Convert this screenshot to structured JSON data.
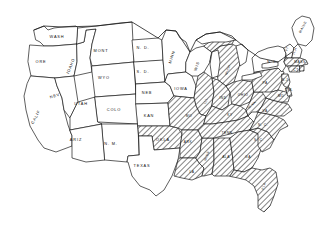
{
  "figure": {
    "background_color": "#ffffff",
    "line_color": "#1a1a1a",
    "shading_style": "diagonal-hatch",
    "shaded_meaning": "highlighted region",
    "width": 335,
    "height": 226
  },
  "legend": {
    "hatched_label": "shaded state",
    "plain_label": "unshaded state"
  },
  "states": [
    {
      "id": "washington",
      "label": "WASH",
      "shaded": false,
      "lx": 57,
      "ly": 37
    },
    {
      "id": "oregon",
      "label": "ORE",
      "shaded": false,
      "lx": 41,
      "ly": 62
    },
    {
      "id": "california",
      "label": "CALIF",
      "shaded": false,
      "lx": 36,
      "ly": 117
    },
    {
      "id": "nevada",
      "label": "NEV",
      "shaded": false,
      "lx": 55,
      "ly": 96
    },
    {
      "id": "idaho",
      "label": "IDAHO",
      "shaded": false,
      "lx": 71,
      "ly": 66
    },
    {
      "id": "montana",
      "label": "MONT",
      "shaded": false,
      "lx": 101,
      "ly": 51
    },
    {
      "id": "wyoming",
      "label": "WYO",
      "shaded": false,
      "lx": 104,
      "ly": 78
    },
    {
      "id": "utah",
      "label": "UTAH",
      "shaded": false,
      "lx": 81,
      "ly": 104
    },
    {
      "id": "colorado",
      "label": "COLO",
      "shaded": false,
      "lx": 114,
      "ly": 110
    },
    {
      "id": "arizona",
      "label": "ARIZ",
      "shaded": false,
      "lx": 76,
      "ly": 140
    },
    {
      "id": "newmexico",
      "label": "N. M.",
      "shaded": false,
      "lx": 111,
      "ly": 144
    },
    {
      "id": "northdakota",
      "label": "N. D.",
      "shaded": false,
      "lx": 143,
      "ly": 48
    },
    {
      "id": "southdakota",
      "label": "S. D.",
      "shaded": false,
      "lx": 143,
      "ly": 72
    },
    {
      "id": "nebraska",
      "label": "NEB",
      "shaded": false,
      "lx": 147,
      "ly": 93
    },
    {
      "id": "kansas",
      "label": "KAN",
      "shaded": false,
      "lx": 149,
      "ly": 116
    },
    {
      "id": "oklahoma",
      "label": "OKLA",
      "shaded": true,
      "lx": 163,
      "ly": 140
    },
    {
      "id": "texas",
      "label": "TEXAS",
      "shaded": false,
      "lx": 142,
      "ly": 166
    },
    {
      "id": "minnesota",
      "label": "MINN",
      "shaded": false,
      "lx": 172,
      "ly": 57
    },
    {
      "id": "iowa",
      "label": "IOWA",
      "shaded": false,
      "lx": 181,
      "ly": 89
    },
    {
      "id": "missouri",
      "label": "MO",
      "shaded": true,
      "lx": 189,
      "ly": 116
    },
    {
      "id": "arkansas",
      "label": "ARK",
      "shaded": true,
      "lx": 188,
      "ly": 142
    },
    {
      "id": "louisiana",
      "label": "LA",
      "shaded": true,
      "lx": 192,
      "ly": 172
    },
    {
      "id": "wisconsin",
      "label": "WIS",
      "shaded": false,
      "lx": 197,
      "ly": 66
    },
    {
      "id": "illinois",
      "label": "ILL",
      "shaded": true,
      "lx": 206,
      "ly": 101
    },
    {
      "id": "michigan",
      "label": "MICH",
      "shaded": true,
      "lx": 228,
      "ly": 70
    },
    {
      "id": "indiana",
      "label": "IND",
      "shaded": true,
      "lx": 223,
      "ly": 98
    },
    {
      "id": "ohio",
      "label": "OHIO",
      "shaded": true,
      "lx": 243,
      "ly": 95
    },
    {
      "id": "kentucky",
      "label": "KY",
      "shaded": true,
      "lx": 230,
      "ly": 115
    },
    {
      "id": "tennessee",
      "label": "TENN",
      "shaded": true,
      "lx": 227,
      "ly": 133
    },
    {
      "id": "mississippi",
      "label": "MISS",
      "shaded": true,
      "lx": 207,
      "ly": 156
    },
    {
      "id": "alabama",
      "label": "ALA",
      "shaded": true,
      "lx": 226,
      "ly": 157
    },
    {
      "id": "georgia",
      "label": "GA",
      "shaded": true,
      "lx": 248,
      "ly": 157
    },
    {
      "id": "florida",
      "label": "FLA",
      "shaded": true,
      "lx": 264,
      "ly": 186
    },
    {
      "id": "southcarolina",
      "label": "S. C.",
      "shaded": true,
      "lx": 259,
      "ly": 140
    },
    {
      "id": "northcarolina",
      "label": "N. C.",
      "shaded": true,
      "lx": 263,
      "ly": 125
    },
    {
      "id": "virginia",
      "label": "VA",
      "shaded": true,
      "lx": 265,
      "ly": 111
    },
    {
      "id": "westvirginia",
      "label": "W.VA",
      "shaded": true,
      "lx": 252,
      "ly": 105
    },
    {
      "id": "pennsylvania",
      "label": "PA",
      "shaded": true,
      "lx": 265,
      "ly": 83
    },
    {
      "id": "newyork",
      "label": "N. Y.",
      "shaded": false,
      "lx": 272,
      "ly": 62
    },
    {
      "id": "maine",
      "label": "MAINE",
      "shaded": false,
      "lx": 303,
      "ly": 27
    },
    {
      "id": "vermont",
      "label": "VT",
      "shaded": false,
      "lx": 287,
      "ly": 49
    },
    {
      "id": "newhampshire",
      "label": "N.H",
      "shaded": false,
      "lx": 295,
      "ly": 51
    },
    {
      "id": "massachusetts",
      "label": "MASS",
      "shaded": true,
      "lx": 300,
      "ly": 62
    },
    {
      "id": "connecticut",
      "label": "CT",
      "shaded": true,
      "lx": 296,
      "ly": 70
    },
    {
      "id": "newjersey",
      "label": "N.J",
      "shaded": true,
      "lx": 285,
      "ly": 80
    },
    {
      "id": "maryland",
      "label": "MD",
      "shaded": true,
      "lx": 281,
      "ly": 96
    },
    {
      "id": "delaware",
      "label": "DEL",
      "shaded": true,
      "lx": 289,
      "ly": 90
    }
  ]
}
